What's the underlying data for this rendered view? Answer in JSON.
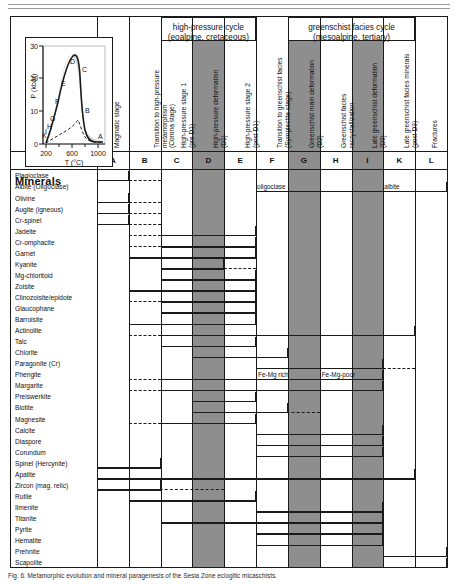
{
  "figure": {
    "minerals_header": "Minerals",
    "caption": "Fig. 6. Metamorphic evolution and mineral paragenesis of the Sesia Zone eclogitic micaschists."
  },
  "inset": {
    "ylabel": "P (kbar)",
    "xlabel": "T (°C)",
    "yticks": [
      "0",
      "10",
      "20",
      "30"
    ],
    "xticks": [
      "200",
      "600",
      "1000"
    ],
    "path_labels": [
      "A",
      "B",
      "C",
      "D",
      "E",
      "F",
      "G",
      "H",
      "I",
      "K"
    ]
  },
  "group_headers": [
    {
      "id": "hp-cycle",
      "line1": "high-pressure cycle",
      "line2": "(eoalpine, cretaceous)"
    },
    {
      "id": "gs-cycle",
      "line1": "greenschist facies cycle",
      "line2": "(mesoalpine, tertiary)"
    }
  ],
  "columns": [
    {
      "letter": "A",
      "caption": "Magmatic stage",
      "shaded": false
    },
    {
      "letter": "B",
      "caption": "Transition to high-pressure\nmetamorphism\n(Corona stage)",
      "shaded": false
    },
    {
      "letter": "C",
      "caption": "High-pressure stage 1\n(pre D1)",
      "shaded": false
    },
    {
      "letter": "D",
      "caption": "High-pressure deformation\n(D1)",
      "shaded": true
    },
    {
      "letter": "E",
      "caption": "High-pressure stage 2\n(post D1)",
      "shaded": false
    },
    {
      "letter": "F",
      "caption": "Transition to greenschist facies\n(Symplectite stage)",
      "shaded": false
    },
    {
      "letter": "G",
      "caption": "Greenschist main deformation\n(D2)",
      "shaded": true
    },
    {
      "letter": "H",
      "caption": "Greenschist facies\nrecrystallization",
      "shaded": false
    },
    {
      "letter": "I",
      "caption": "Late greenschist deformation\n(D3)",
      "shaded": true
    },
    {
      "letter": "K",
      "caption": "Late greenschist facies minerals\n(post D3)",
      "shaded": false
    },
    {
      "letter": "L",
      "caption": "Fractures",
      "shaded": false
    }
  ],
  "minerals": [
    {
      "name": "Plagioclase",
      "bars": [
        {
          "from": "A",
          "to": "A",
          "style": "solid"
        },
        {
          "from": "B",
          "to": "B",
          "style": "dashed"
        }
      ]
    },
    {
      "name": "Albite (Oligoclase)",
      "bars": [
        {
          "from": "F",
          "to": "L",
          "style": "solid"
        }
      ]
    },
    {
      "name": "Olivine",
      "bars": [
        {
          "from": "A",
          "to": "A",
          "style": "solid"
        },
        {
          "from": "B",
          "to": "B",
          "style": "dashed"
        }
      ]
    },
    {
      "name": "Augite (igneous)",
      "bars": [
        {
          "from": "A",
          "to": "A",
          "style": "solid"
        },
        {
          "from": "B",
          "to": "B",
          "style": "dashed"
        }
      ]
    },
    {
      "name": "Cr-spinel",
      "bars": [
        {
          "from": "A",
          "to": "A",
          "style": "solid"
        },
        {
          "from": "B",
          "to": "B",
          "style": "dashed"
        }
      ]
    },
    {
      "name": "Jadeite",
      "bars": [
        {
          "from": "B",
          "to": "B",
          "style": "dashed"
        },
        {
          "from": "C",
          "to": "E",
          "style": "solid"
        }
      ]
    },
    {
      "name": "Cr-omphacite",
      "bars": [
        {
          "from": "B",
          "to": "B",
          "style": "dashed"
        },
        {
          "from": "C",
          "to": "E",
          "style": "solid"
        }
      ]
    },
    {
      "name": "Garnet",
      "bars": [
        {
          "from": "B",
          "to": "B",
          "style": "dashed"
        },
        {
          "from": "B",
          "to": "E",
          "style": "solid"
        }
      ]
    },
    {
      "name": "Kyanite",
      "bars": [
        {
          "from": "C",
          "to": "D",
          "style": "solid"
        },
        {
          "from": "E",
          "to": "E",
          "style": "dashed"
        }
      ]
    },
    {
      "name": "Mg-chloritoid",
      "bars": [
        {
          "from": "C",
          "to": "E",
          "style": "solid"
        }
      ]
    },
    {
      "name": "Zoisite",
      "bars": [
        {
          "from": "B",
          "to": "E",
          "style": "solid"
        }
      ]
    },
    {
      "name": "Clinozoisite/epidote",
      "bars": [
        {
          "from": "B",
          "to": "B",
          "style": "dashed"
        },
        {
          "from": "C",
          "to": "E",
          "style": "solid"
        }
      ]
    },
    {
      "name": "Glaucophane",
      "bars": [
        {
          "from": "C",
          "to": "E",
          "style": "solid"
        }
      ]
    },
    {
      "name": "Barroisite",
      "bars": [
        {
          "from": "B",
          "to": "E",
          "style": "solid"
        }
      ]
    },
    {
      "name": "Actinolite",
      "bars": [
        {
          "from": "B",
          "to": "B",
          "style": "dashed"
        },
        {
          "from": "C",
          "to": "K",
          "style": "solid"
        }
      ]
    },
    {
      "name": "Talc",
      "bars": [
        {
          "from": "C",
          "to": "E",
          "style": "solid"
        }
      ]
    },
    {
      "name": "Chlorite",
      "bars": [
        {
          "from": "D",
          "to": "F",
          "style": "solid"
        }
      ]
    },
    {
      "name": "Paragonite (Cr)",
      "bars": [
        {
          "from": "F",
          "to": "I",
          "style": "solid"
        },
        {
          "from": "K",
          "to": "K",
          "style": "dashed"
        }
      ]
    },
    {
      "name": "Phengite",
      "bars": [
        {
          "from": "B",
          "to": "B",
          "style": "dashed"
        },
        {
          "from": "C",
          "to": "I",
          "style": "solid"
        }
      ],
      "annotations": [
        {
          "text": "Fe-Mg rich",
          "col": "F"
        },
        {
          "text": "Fe-Mg-poor",
          "col": "H"
        }
      ]
    },
    {
      "name": "Margarite",
      "bars": [
        {
          "from": "B",
          "to": "B",
          "style": "dashed"
        },
        {
          "from": "C",
          "to": "I",
          "style": "solid"
        }
      ]
    },
    {
      "name": "Preiswerkite",
      "bars": [
        {
          "from": "D",
          "to": "E",
          "style": "solid"
        }
      ]
    },
    {
      "name": "Biotite",
      "bars": [
        {
          "from": "D",
          "to": "F",
          "style": "solid"
        },
        {
          "from": "F",
          "to": "G",
          "style": "dashed"
        }
      ]
    },
    {
      "name": "Magnesite",
      "bars": [
        {
          "from": "B",
          "to": "B",
          "style": "dashed"
        },
        {
          "from": "C",
          "to": "E",
          "style": "solid"
        }
      ]
    },
    {
      "name": "Calcite",
      "bars": [
        {
          "from": "F",
          "to": "I",
          "style": "solid"
        }
      ]
    },
    {
      "name": "Diaspore",
      "bars": [
        {
          "from": "F",
          "to": "I",
          "style": "solid"
        }
      ]
    },
    {
      "name": "Corundum",
      "bars": [
        {
          "from": "F",
          "to": "I",
          "style": "solid"
        }
      ]
    },
    {
      "name": "Spinel (Hercynite)",
      "bars": [
        {
          "from": "A",
          "to": "B",
          "style": "solid"
        }
      ]
    },
    {
      "name": "Apatite",
      "bars": [
        {
          "from": "A",
          "to": "K",
          "style": "solid"
        }
      ]
    },
    {
      "name": "Zircon (mag. relic)",
      "bars": [
        {
          "from": "A",
          "to": "B",
          "style": "solid"
        },
        {
          "from": "B",
          "to": "D",
          "style": "dashed"
        }
      ]
    },
    {
      "name": "Rutile",
      "bars": [
        {
          "from": "B",
          "to": "E",
          "style": "solid"
        }
      ]
    },
    {
      "name": "Ilmenite",
      "bars": [
        {
          "from": "F",
          "to": "I",
          "style": "solid"
        }
      ]
    },
    {
      "name": "Titanite",
      "bars": [
        {
          "from": "C",
          "to": "I",
          "style": "solid"
        }
      ]
    },
    {
      "name": "Pyrite",
      "bars": [
        {
          "from": "F",
          "to": "I",
          "style": "solid"
        }
      ]
    },
    {
      "name": "Hematite",
      "bars": [
        {
          "from": "F",
          "to": "I",
          "style": "solid"
        }
      ]
    },
    {
      "name": "Prehnite",
      "bars": [
        {
          "from": "K",
          "to": "L",
          "style": "solid"
        }
      ]
    },
    {
      "name": "Scapolite",
      "bars": [
        {
          "from": "K",
          "to": "L",
          "style": "solid"
        }
      ]
    }
  ],
  "colors": {
    "shade": "#8e8e8e",
    "line": "#1a1a1a",
    "curve_fill": "#d8d8d8"
  }
}
